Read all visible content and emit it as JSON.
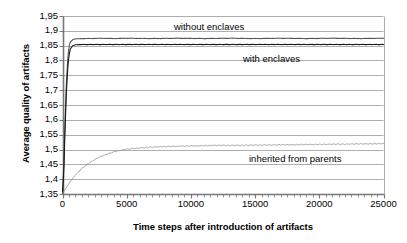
{
  "chart_data": {
    "type": "line",
    "title": "",
    "xlabel": "Time steps after introduction of artifacts",
    "ylabel": "Average quality of artifacts",
    "xlim": [
      0,
      25000
    ],
    "ylim": [
      1.35,
      1.95
    ],
    "grid": true,
    "legend_position": "inline-annotations",
    "xticks": [
      0,
      5000,
      10000,
      15000,
      20000,
      25000
    ],
    "xtick_labels": [
      "0",
      "5000",
      "10000",
      "15000",
      "20000",
      "25000"
    ],
    "yticks": [
      1.35,
      1.4,
      1.45,
      1.5,
      1.55,
      1.6,
      1.65,
      1.7,
      1.75,
      1.8,
      1.85,
      1.9,
      1.95
    ],
    "ytick_labels": [
      "1,35",
      "1,4",
      "1,45",
      "1,5",
      "1,55",
      "1,6",
      "1,65",
      "1,7",
      "1,75",
      "1,8",
      "1,85",
      "1,9",
      "1,95"
    ],
    "decimal_separator": ",",
    "series": [
      {
        "name": "without enclaves",
        "color": "#555555",
        "annotation": "without enclaves",
        "x": [
          0,
          100,
          200,
          300,
          400,
          500,
          600,
          800,
          1000,
          1500,
          2000,
          3000,
          4000,
          5000,
          7000,
          9000,
          11000,
          13000,
          15000,
          17000,
          19000,
          21000,
          23000,
          25000
        ],
        "y": [
          1.352,
          1.44,
          1.6,
          1.72,
          1.8,
          1.845,
          1.862,
          1.87,
          1.873,
          1.874,
          1.874,
          1.875,
          1.874,
          1.875,
          1.874,
          1.875,
          1.874,
          1.875,
          1.874,
          1.875,
          1.874,
          1.875,
          1.874,
          1.875
        ]
      },
      {
        "name": "with enclaves",
        "color": "#1a1a1a",
        "annotation": "with enclaves",
        "x": [
          0,
          100,
          200,
          300,
          400,
          500,
          600,
          800,
          1000,
          1500,
          2000,
          3000,
          5000,
          8000,
          11000,
          14000,
          17000,
          20000,
          23000,
          25000
        ],
        "y": [
          1.352,
          1.42,
          1.57,
          1.69,
          1.77,
          1.815,
          1.838,
          1.85,
          1.853,
          1.854,
          1.854,
          1.854,
          1.854,
          1.854,
          1.854,
          1.854,
          1.854,
          1.854,
          1.854,
          1.854
        ]
      },
      {
        "name": "inherited from parents",
        "color": "#9a9a9a",
        "annotation": "inherited from parents",
        "x": [
          0,
          250,
          500,
          750,
          1000,
          1500,
          2000,
          2500,
          3000,
          3500,
          4000,
          4500,
          5000,
          6000,
          7000,
          8000,
          9000,
          10000,
          11000,
          12000,
          13000,
          14000,
          15000,
          16000,
          17000,
          18000,
          19000,
          20000,
          21000,
          22000,
          23000,
          24000,
          25000
        ],
        "y": [
          1.352,
          1.368,
          1.385,
          1.4,
          1.414,
          1.436,
          1.452,
          1.466,
          1.477,
          1.485,
          1.492,
          1.497,
          1.501,
          1.505,
          1.508,
          1.51,
          1.511,
          1.512,
          1.513,
          1.514,
          1.514,
          1.514,
          1.515,
          1.515,
          1.516,
          1.516,
          1.517,
          1.517,
          1.518,
          1.518,
          1.519,
          1.519,
          1.52
        ]
      }
    ]
  },
  "axis": {
    "y_title": "Average quality of artifacts",
    "x_title": "Time steps after introduction of artifacts"
  },
  "annotations": {
    "without_enclaves": "without enclaves",
    "with_enclaves": "with enclaves",
    "inherited_from_parents": "inherited from parents"
  },
  "colors": {
    "without_enclaves": "#555555",
    "with_enclaves": "#1a1a1a",
    "inherited_from_parents": "#9a9a9a",
    "grid": "#999999",
    "axis": "#666666",
    "background": "#ffffff"
  }
}
